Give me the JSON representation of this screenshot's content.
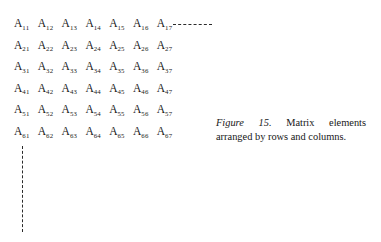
{
  "figure": {
    "matrix": {
      "rows": [
        {
          "cells": [
            {
              "base": "A",
              "sub": "11"
            },
            {
              "base": "A",
              "sub": "12"
            },
            {
              "base": "A",
              "sub": "13"
            },
            {
              "base": "A",
              "sub": "14"
            },
            {
              "base": "A",
              "sub": "15"
            },
            {
              "base": "A",
              "sub": "16"
            },
            {
              "base": "A",
              "sub": "17"
            }
          ]
        },
        {
          "cells": [
            {
              "base": "A",
              "sub": "21"
            },
            {
              "base": "A",
              "sub": "22"
            },
            {
              "base": "A",
              "sub": "23"
            },
            {
              "base": "A",
              "sub": "24"
            },
            {
              "base": "A",
              "sub": "25"
            },
            {
              "base": "A",
              "sub": "26"
            },
            {
              "base": "A",
              "sub": "27"
            }
          ]
        },
        {
          "cells": [
            {
              "base": "A",
              "sub": "31"
            },
            {
              "base": "A",
              "sub": "32"
            },
            {
              "base": "A",
              "sub": "33"
            },
            {
              "base": "A",
              "sub": "34"
            },
            {
              "base": "A",
              "sub": "35"
            },
            {
              "base": "A",
              "sub": "36"
            },
            {
              "base": "A",
              "sub": "37"
            }
          ]
        },
        {
          "cells": [
            {
              "base": "A",
              "sub": "41"
            },
            {
              "base": "A",
              "sub": "42"
            },
            {
              "base": "A",
              "sub": "43"
            },
            {
              "base": "A",
              "sub": "44"
            },
            {
              "base": "A",
              "sub": "45"
            },
            {
              "base": "A",
              "sub": "46"
            },
            {
              "base": "A",
              "sub": "47"
            }
          ]
        },
        {
          "cells": [
            {
              "base": "A",
              "sub": "51"
            },
            {
              "base": "A",
              "sub": "52"
            },
            {
              "base": "A",
              "sub": "53"
            },
            {
              "base": "A",
              "sub": "54"
            },
            {
              "base": "A",
              "sub": "55"
            },
            {
              "base": "A",
              "sub": "56"
            },
            {
              "base": "A",
              "sub": "57"
            }
          ]
        },
        {
          "cells": [
            {
              "base": "A",
              "sub": "61"
            },
            {
              "base": "A",
              "sub": "62"
            },
            {
              "base": "A",
              "sub": "63"
            },
            {
              "base": "A",
              "sub": "64"
            },
            {
              "base": "A",
              "sub": "65"
            },
            {
              "base": "A",
              "sub": "66"
            },
            {
              "base": "A",
              "sub": "67"
            }
          ]
        }
      ]
    },
    "caption": {
      "label": "Figure 15.",
      "text": " Matrix elements arranged by rows and columns."
    },
    "colors": {
      "ink": "#171717",
      "rule": "#2a2a2a",
      "page": "#ffffff"
    }
  }
}
